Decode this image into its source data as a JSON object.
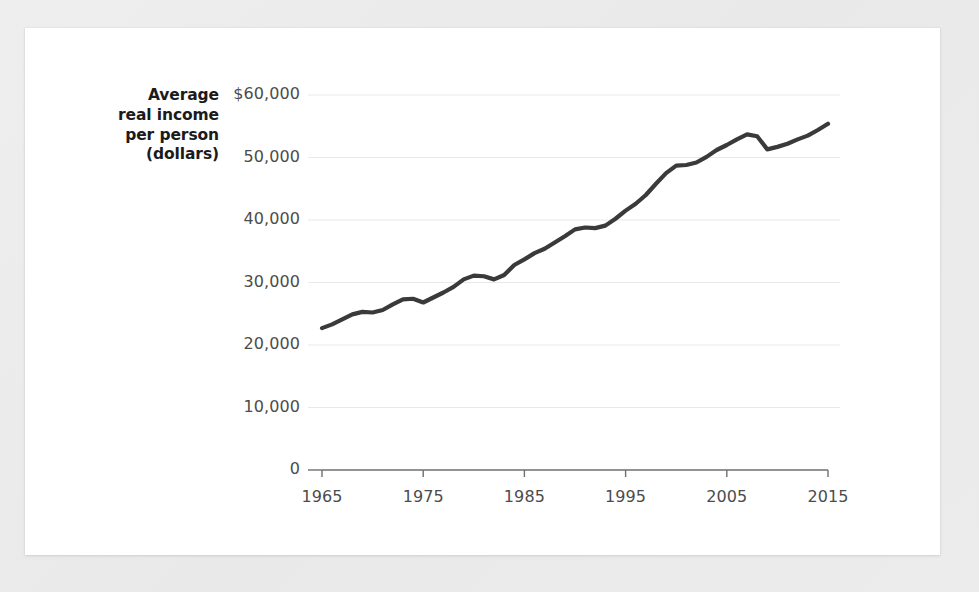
{
  "chart_data": {
    "type": "line",
    "title": "",
    "subtitle": "",
    "xlabel": "",
    "ylabel": "Average real income per person (dollars)",
    "ylabel_lines": [
      "Average",
      "real income",
      "per person",
      "(dollars)"
    ],
    "grid": true,
    "legend": "none",
    "line_color": "#3a3a3a",
    "grid_color": "#e9e9e9",
    "axis_color": "#6f6f6f",
    "tick_text_color": "#4c4c4c",
    "title_text_color": "#1b1b1b",
    "background_color": "#ffffff",
    "page_background_color": "#ececec",
    "xlim": [
      1965,
      2015
    ],
    "ylim": [
      0,
      60000
    ],
    "xticks": [
      1965,
      1975,
      1985,
      1995,
      2005,
      2015
    ],
    "xtick_labels": [
      "1965",
      "1975",
      "1985",
      "1995",
      "2005",
      "2015"
    ],
    "yticks": [
      0,
      10000,
      20000,
      30000,
      40000,
      50000,
      60000
    ],
    "ytick_labels": [
      "0",
      "10,000",
      "20,000",
      "30,000",
      "40,000",
      "50,000",
      "$60,000"
    ],
    "x": [
      1965,
      1966,
      1967,
      1968,
      1969,
      1970,
      1971,
      1972,
      1973,
      1974,
      1975,
      1976,
      1977,
      1978,
      1979,
      1980,
      1981,
      1982,
      1983,
      1984,
      1985,
      1986,
      1987,
      1988,
      1989,
      1990,
      1991,
      1992,
      1993,
      1994,
      1995,
      1996,
      1997,
      1998,
      1999,
      2000,
      2001,
      2002,
      2003,
      2004,
      2005,
      2006,
      2007,
      2008,
      2009,
      2010,
      2011,
      2012,
      2013,
      2014,
      2015
    ],
    "values": [
      22700,
      23300,
      24100,
      24900,
      25300,
      25200,
      25600,
      26500,
      27300,
      27400,
      26800,
      27600,
      28400,
      29300,
      30500,
      31100,
      31000,
      30500,
      31200,
      32800,
      33700,
      34700,
      35400,
      36400,
      37400,
      38500,
      38800,
      38700,
      39100,
      40200,
      41500,
      42600,
      44000,
      45800,
      47500,
      48700,
      48800,
      49200,
      50100,
      51200,
      52000,
      52900,
      53700,
      53400,
      51300,
      51700,
      52200,
      52900,
      53500,
      54400,
      55400
    ],
    "series_name": "Average real income per person",
    "annotations": []
  },
  "axis": {
    "y_title_lines": [
      "Average",
      "real income",
      "per person",
      "(dollars)"
    ]
  }
}
